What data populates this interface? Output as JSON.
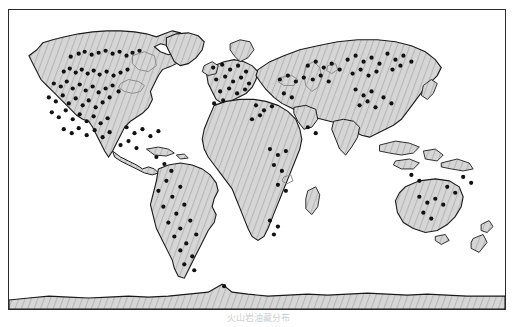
{
  "figure": {
    "caption": "火山岩油藏分布"
  },
  "legend": {
    "symbol_name": "black-dot-symbol",
    "label": "火山岩油藏分布区"
  },
  "colors": {
    "frame": "#2b2b2b",
    "land_fill": "#d2d2d2",
    "land_hatch": "#b4b4b4",
    "coastline": "#1a1a1a",
    "inland_water": "#8a8a8a",
    "dot": "#111111",
    "ocean": "#ffffff"
  },
  "map": {
    "projection_note": "world-outline",
    "regions": [
      "North America",
      "South America",
      "Europe",
      "Africa",
      "Asia",
      "Australia",
      "Antarctica"
    ]
  },
  "chart_data": {
    "type": "scatter",
    "title": "火山岩油藏分布区",
    "xlabel": "",
    "ylabel": "",
    "xlim": [
      0,
      498
    ],
    "ylim": [
      0,
      301
    ],
    "grid": false,
    "legend_position": "bottom-right",
    "series": [
      {
        "name": "火山岩油藏分布区",
        "marker": "filled-circle",
        "color": "#111111",
        "points": [
          [
            62,
            47
          ],
          [
            70,
            44
          ],
          [
            76,
            42
          ],
          [
            83,
            45
          ],
          [
            90,
            43
          ],
          [
            97,
            41
          ],
          [
            104,
            44
          ],
          [
            111,
            42
          ],
          [
            118,
            46
          ],
          [
            124,
            43
          ],
          [
            131,
            41
          ],
          [
            55,
            62
          ],
          [
            61,
            59
          ],
          [
            67,
            63
          ],
          [
            73,
            60
          ],
          [
            79,
            64
          ],
          [
            85,
            61
          ],
          [
            91,
            65
          ],
          [
            98,
            62
          ],
          [
            105,
            66
          ],
          [
            112,
            63
          ],
          [
            119,
            60
          ],
          [
            45,
            74
          ],
          [
            52,
            77
          ],
          [
            58,
            72
          ],
          [
            64,
            79
          ],
          [
            71,
            75
          ],
          [
            77,
            81
          ],
          [
            84,
            77
          ],
          [
            90,
            83
          ],
          [
            97,
            79
          ],
          [
            104,
            76
          ],
          [
            110,
            82
          ],
          [
            40,
            88
          ],
          [
            47,
            92
          ],
          [
            54,
            86
          ],
          [
            60,
            94
          ],
          [
            67,
            89
          ],
          [
            74,
            96
          ],
          [
            80,
            91
          ],
          [
            87,
            98
          ],
          [
            94,
            93
          ],
          [
            101,
            88
          ],
          [
            43,
            103
          ],
          [
            50,
            108
          ],
          [
            57,
            101
          ],
          [
            64,
            110
          ],
          [
            71,
            105
          ],
          [
            78,
            112
          ],
          [
            85,
            107
          ],
          [
            92,
            114
          ],
          [
            99,
            109
          ],
          [
            55,
            120
          ],
          [
            63,
            124
          ],
          [
            70,
            119
          ],
          [
            78,
            126
          ],
          [
            86,
            121
          ],
          [
            94,
            128
          ],
          [
            101,
            123
          ],
          [
            118,
            118
          ],
          [
            126,
            124
          ],
          [
            134,
            120
          ],
          [
            142,
            127
          ],
          [
            150,
            122
          ],
          [
            112,
            136
          ],
          [
            120,
            132
          ],
          [
            128,
            139
          ],
          [
            148,
            148
          ],
          [
            156,
            155
          ],
          [
            163,
            162
          ],
          [
            158,
            172
          ],
          [
            150,
            182
          ],
          [
            164,
            188
          ],
          [
            172,
            178
          ],
          [
            155,
            198
          ],
          [
            168,
            205
          ],
          [
            176,
            196
          ],
          [
            160,
            214
          ],
          [
            172,
            220
          ],
          [
            182,
            212
          ],
          [
            166,
            228
          ],
          [
            178,
            235
          ],
          [
            188,
            226
          ],
          [
            172,
            242
          ],
          [
            184,
            248
          ],
          [
            176,
            256
          ],
          [
            186,
            262
          ],
          [
            205,
            58
          ],
          [
            214,
            55
          ],
          [
            222,
            60
          ],
          [
            230,
            56
          ],
          [
            238,
            62
          ],
          [
            208,
            70
          ],
          [
            217,
            67
          ],
          [
            225,
            72
          ],
          [
            233,
            68
          ],
          [
            241,
            74
          ],
          [
            212,
            82
          ],
          [
            221,
            79
          ],
          [
            229,
            84
          ],
          [
            237,
            80
          ],
          [
            206,
            94
          ],
          [
            215,
            91
          ],
          [
            248,
            96
          ],
          [
            256,
            101
          ],
          [
            264,
            97
          ],
          [
            244,
            110
          ],
          [
            252,
            106
          ],
          [
            272,
            70
          ],
          [
            280,
            66
          ],
          [
            288,
            72
          ],
          [
            296,
            68
          ],
          [
            276,
            84
          ],
          [
            284,
            88
          ],
          [
            300,
            56
          ],
          [
            308,
            52
          ],
          [
            316,
            58
          ],
          [
            324,
            54
          ],
          [
            332,
            60
          ],
          [
            305,
            70
          ],
          [
            313,
            66
          ],
          [
            321,
            72
          ],
          [
            340,
            50
          ],
          [
            348,
            46
          ],
          [
            356,
            52
          ],
          [
            364,
            48
          ],
          [
            372,
            54
          ],
          [
            345,
            64
          ],
          [
            353,
            60
          ],
          [
            361,
            66
          ],
          [
            369,
            62
          ],
          [
            380,
            44
          ],
          [
            388,
            50
          ],
          [
            396,
            46
          ],
          [
            404,
            52
          ],
          [
            385,
            60
          ],
          [
            393,
            56
          ],
          [
            348,
            80
          ],
          [
            356,
            86
          ],
          [
            364,
            82
          ],
          [
            352,
            96
          ],
          [
            360,
            92
          ],
          [
            368,
            98
          ],
          [
            376,
            88
          ],
          [
            384,
            94
          ],
          [
            262,
            140
          ],
          [
            270,
            146
          ],
          [
            278,
            142
          ],
          [
            266,
            156
          ],
          [
            274,
            162
          ],
          [
            270,
            176
          ],
          [
            278,
            182
          ],
          [
            262,
            212
          ],
          [
            270,
            218
          ],
          [
            266,
            226
          ],
          [
            300,
            118
          ],
          [
            308,
            124
          ],
          [
            412,
            188
          ],
          [
            420,
            194
          ],
          [
            428,
            190
          ],
          [
            436,
            196
          ],
          [
            416,
            204
          ],
          [
            424,
            210
          ],
          [
            440,
            178
          ],
          [
            448,
            184
          ],
          [
            404,
            166
          ],
          [
            412,
            172
          ],
          [
            456,
            168
          ],
          [
            464,
            174
          ],
          [
            216,
            278
          ]
        ]
      }
    ]
  }
}
